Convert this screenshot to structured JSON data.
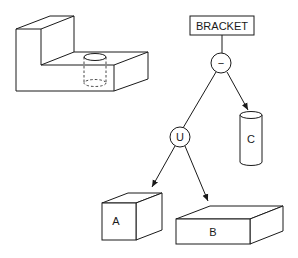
{
  "diagram": {
    "type": "CSG tree",
    "root": {
      "label": "BRACKET"
    },
    "operators": [
      {
        "id": "difference",
        "symbol": "−"
      },
      {
        "id": "union",
        "symbol": "U"
      }
    ],
    "primitives": [
      {
        "id": "A",
        "label": "A",
        "shape": "box"
      },
      {
        "id": "B",
        "label": "B",
        "shape": "box"
      },
      {
        "id": "C",
        "label": "C",
        "shape": "cylinder"
      }
    ],
    "edges": [
      {
        "from": "BRACKET",
        "to": "difference"
      },
      {
        "from": "difference",
        "to": "union"
      },
      {
        "from": "difference",
        "to": "C"
      },
      {
        "from": "union",
        "to": "A"
      },
      {
        "from": "union",
        "to": "B"
      }
    ],
    "illustration": "L-shaped bracket with cylindrical hole (hidden lines dashed)"
  }
}
